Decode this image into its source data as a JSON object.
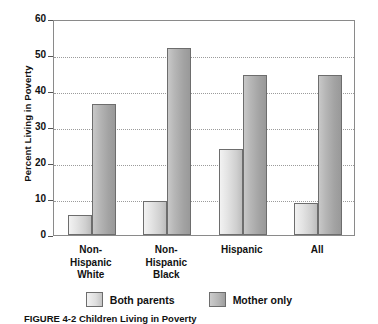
{
  "chart_data": {
    "type": "bar",
    "title": "",
    "xlabel": "",
    "ylabel": "Percent Living in Poverty",
    "ylim": [
      0,
      60
    ],
    "yticks": [
      0,
      10,
      20,
      30,
      40,
      50,
      60
    ],
    "ytick_labels": [
      "0",
      "10",
      "20",
      "30",
      "40",
      "50",
      "60"
    ],
    "grid": "horizontal-dotted",
    "legend_position": "bottom-center",
    "categories": [
      "Non-Hispanic White",
      "Non-Hispanic Black",
      "Hispanic",
      "All"
    ],
    "category_lines": [
      [
        "Non-",
        "Hispanic",
        "White"
      ],
      [
        "Non-",
        "Hispanic",
        "Black"
      ],
      [
        "Hispanic"
      ],
      [
        "All"
      ]
    ],
    "series": [
      {
        "name": "Both parents",
        "values": [
          5.5,
          9.5,
          24,
          9
        ]
      },
      {
        "name": "Mother only",
        "values": [
          36.5,
          52,
          44.5,
          44.5
        ]
      }
    ]
  },
  "legend": {
    "items": [
      {
        "label": "Both parents",
        "key": "both"
      },
      {
        "label": "Mother only",
        "key": "mother"
      }
    ]
  },
  "caption": {
    "text": "FIGURE 4-2  Children Living in Poverty"
  },
  "colors": {
    "both_parents_fill": "#e3e3e3",
    "mother_only_fill": "#b0b0b0",
    "bar_outline": "#6d6d6d",
    "gridline": "#9b9b9b",
    "frame": "#8a8a8a",
    "text": "#111111",
    "background": "#ffffff"
  }
}
